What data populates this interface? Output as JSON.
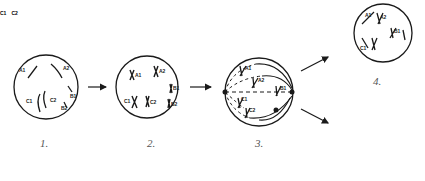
{
  "diagram": {
    "type": "cell-division-stages",
    "stroke_color": "#1a1a1a",
    "stages": [
      {
        "id": 1,
        "caption": "1.",
        "labels": [
          "A1",
          "A2",
          "C1",
          "C2",
          "B1",
          "B2"
        ]
      },
      {
        "id": 2,
        "caption": "2.",
        "labels": [
          "A1",
          "A2",
          "C1",
          "C2",
          "B1",
          "B2"
        ]
      },
      {
        "id": 3,
        "caption": "3.",
        "labels": [
          "A1",
          "A2",
          "C1",
          "C2",
          "B1",
          "B2"
        ]
      },
      {
        "id": 4,
        "caption": "4.",
        "labels": [
          "A1",
          "A2",
          "B1",
          "B2",
          "C1",
          "C2"
        ]
      },
      {
        "id": 5,
        "caption": "",
        "labels": [
          "A1",
          "A2",
          "B1",
          "B2",
          "C1",
          "C2"
        ]
      }
    ],
    "arrows": [
      "1→2",
      "2→3",
      "3→4 (upper)",
      "3→5 (lower)"
    ]
  }
}
